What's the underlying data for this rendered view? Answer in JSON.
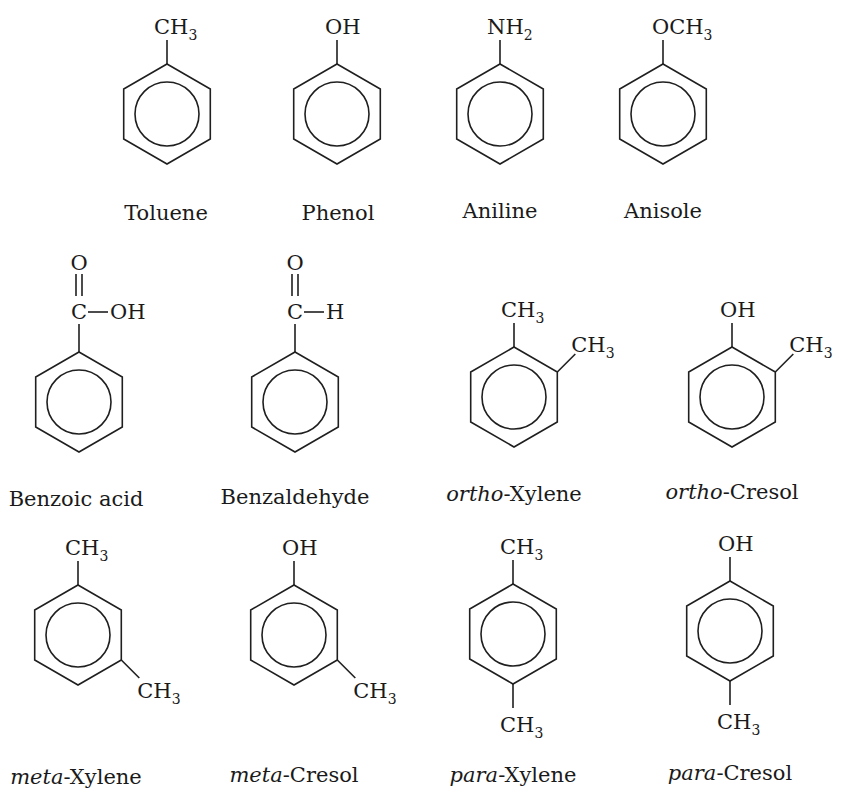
{
  "compounds": [
    {
      "name": "Toluene",
      "prefix": "",
      "base": "Toluene",
      "cx": 167,
      "cy": 114,
      "substituents": [
        {
          "pos": "top",
          "main": "CH",
          "sub": "3"
        }
      ]
    },
    {
      "name": "Phenol",
      "prefix": "",
      "base": "Phenol",
      "cx": 337,
      "cy": 114,
      "substituents": [
        {
          "pos": "top",
          "main": "OH",
          "sub": ""
        }
      ]
    },
    {
      "name": "Aniline",
      "prefix": "",
      "base": "Aniline",
      "cx": 500,
      "cy": 114,
      "substituents": [
        {
          "pos": "top",
          "main": "NH",
          "sub": "2"
        }
      ]
    },
    {
      "name": "Anisole",
      "prefix": "",
      "base": "Anisole",
      "cx": 663,
      "cy": 114,
      "substituents": [
        {
          "pos": "top",
          "main": "OCH",
          "sub": "3"
        }
      ]
    },
    {
      "name": "Benzoic acid",
      "prefix": "",
      "base": "Benzoic acid",
      "cx": 79,
      "cy": 402,
      "carbonyl": {
        "o": "O",
        "c": "C",
        "r": "OH"
      }
    },
    {
      "name": "Benzaldehyde",
      "prefix": "",
      "base": "Benzaldehyde",
      "cx": 295,
      "cy": 402,
      "carbonyl": {
        "o": "O",
        "c": "C",
        "r": "H"
      }
    },
    {
      "name": "ortho-Xylene",
      "prefix": "ortho",
      "base": "-Xylene",
      "cx": 514,
      "cy": 397,
      "substituents": [
        {
          "pos": "top",
          "main": "CH",
          "sub": "3"
        },
        {
          "pos": "upper-right",
          "main": "CH",
          "sub": "3"
        }
      ]
    },
    {
      "name": "ortho-Cresol",
      "prefix": "ortho",
      "base": "-Cresol",
      "cx": 732,
      "cy": 397,
      "substituents": [
        {
          "pos": "top",
          "main": "OH",
          "sub": ""
        },
        {
          "pos": "upper-right",
          "main": "CH",
          "sub": "3"
        }
      ]
    },
    {
      "name": "meta-Xylene",
      "prefix": "meta",
      "base": "-Xylene",
      "cx": 78,
      "cy": 635,
      "substituents": [
        {
          "pos": "top",
          "main": "CH",
          "sub": "3"
        },
        {
          "pos": "lower-right",
          "main": "CH",
          "sub": "3"
        }
      ]
    },
    {
      "name": "meta-Cresol",
      "prefix": "meta",
      "base": "-Cresol",
      "cx": 294,
      "cy": 635,
      "substituents": [
        {
          "pos": "top",
          "main": "OH",
          "sub": ""
        },
        {
          "pos": "lower-right",
          "main": "CH",
          "sub": "3"
        }
      ]
    },
    {
      "name": "para-Xylene",
      "prefix": "para",
      "base": "-Xylene",
      "cx": 513,
      "cy": 634,
      "substituents": [
        {
          "pos": "top",
          "main": "CH",
          "sub": "3"
        },
        {
          "pos": "bottom",
          "main": "CH",
          "sub": "3"
        }
      ]
    },
    {
      "name": "para-Cresol",
      "prefix": "para",
      "base": "-Cresol",
      "cx": 730,
      "cy": 631,
      "substituents": [
        {
          "pos": "top",
          "main": "OH",
          "sub": ""
        },
        {
          "pos": "bottom",
          "main": "CH",
          "sub": "3"
        }
      ]
    }
  ],
  "labels": [
    {
      "x": 166,
      "y": 220
    },
    {
      "x": 338,
      "y": 220
    },
    {
      "x": 500,
      "y": 218
    },
    {
      "x": 663,
      "y": 218
    },
    {
      "x": 76,
      "y": 506
    },
    {
      "x": 295,
      "y": 504
    },
    {
      "x": 514,
      "y": 501
    },
    {
      "x": 732,
      "y": 499
    },
    {
      "x": 76,
      "y": 784
    },
    {
      "x": 294,
      "y": 782
    },
    {
      "x": 513,
      "y": 782
    },
    {
      "x": 730,
      "y": 780
    }
  ],
  "style": {
    "ink": "#1f1f1f",
    "background": "#ffffff",
    "ring_radius": 50,
    "inner_radius": 32
  }
}
